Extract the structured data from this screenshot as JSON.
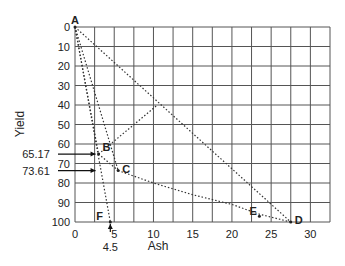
{
  "chart_data": {
    "type": "line",
    "title": "",
    "xlabel": "Ash",
    "ylabel": "Yield",
    "xlim": [
      0,
      32.5
    ],
    "ylim": [
      0,
      100
    ],
    "y_inverted": true,
    "grid": true,
    "x_grid_step": 2.5,
    "y_grid_step": 10,
    "x_ticks": [
      0,
      5,
      10,
      15,
      20,
      25,
      30
    ],
    "y_ticks": [
      0,
      10,
      20,
      30,
      40,
      50,
      60,
      70,
      80,
      90,
      100
    ],
    "points": [
      {
        "label": "A",
        "x": 0,
        "y": 0
      },
      {
        "label": "B",
        "x": 3.0,
        "y": 65.17
      },
      {
        "label": "C",
        "x": 5.5,
        "y": 73.61
      },
      {
        "label": "D",
        "x": 27.5,
        "y": 100
      },
      {
        "label": "E",
        "x": 23.5,
        "y": 97
      },
      {
        "label": "F",
        "x": 4.5,
        "y": 100
      }
    ],
    "series": [
      {
        "name": "A-D",
        "style": "dotted",
        "x": [
          0,
          27.5
        ],
        "y": [
          0,
          100
        ]
      },
      {
        "name": "A-F",
        "style": "dotted",
        "x": [
          0,
          4.5
        ],
        "y": [
          0,
          100
        ]
      },
      {
        "name": "A-B",
        "style": "dotted",
        "x": [
          0,
          3.0
        ],
        "y": [
          0,
          65.17
        ]
      },
      {
        "name": "A-C",
        "style": "dotted",
        "x": [
          0,
          5.5
        ],
        "y": [
          0,
          73.61
        ]
      },
      {
        "name": "B-C",
        "style": "dotted",
        "x": [
          3.0,
          5.5
        ],
        "y": [
          65.17,
          73.61
        ]
      },
      {
        "name": "B-AD intersection",
        "style": "dotted",
        "x": [
          3.0,
          10.5
        ],
        "y": [
          65.17,
          40
        ]
      },
      {
        "name": "C-D curve",
        "style": "dotted",
        "x": [
          5.5,
          10,
          15,
          20,
          23.5,
          27.5
        ],
        "y": [
          73.61,
          80,
          86,
          91,
          96,
          100
        ]
      }
    ],
    "annotations": [
      {
        "text": "65.17",
        "arrow_to_y": 65.17
      },
      {
        "text": "73.61",
        "arrow_to_y": 73.61
      },
      {
        "text": "4.5",
        "arrow_to_x": 4.5
      }
    ]
  }
}
